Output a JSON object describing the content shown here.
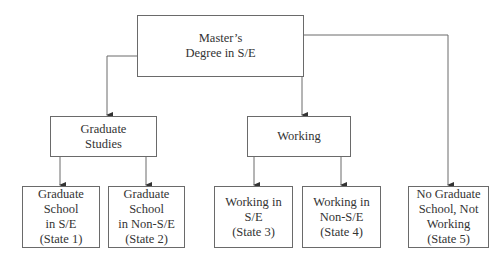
{
  "diagram": {
    "root": {
      "lines": [
        "Master’s",
        "Degree in S/E"
      ]
    },
    "branches": [
      {
        "id": "graduate-studies",
        "lines": [
          "Graduate",
          "Studies"
        ]
      },
      {
        "id": "working",
        "lines": [
          "Working"
        ]
      }
    ],
    "states": [
      {
        "id": "state-1",
        "lines": [
          "Graduate School",
          "in S/E",
          "(State 1)"
        ]
      },
      {
        "id": "state-2",
        "lines": [
          "Graduate School",
          "in Non-S/E",
          "(State 2)"
        ]
      },
      {
        "id": "state-3",
        "lines": [
          "Working in",
          "S/E",
          "(State 3)"
        ]
      },
      {
        "id": "state-4",
        "lines": [
          "Working in",
          "Non-S/E",
          "(State 4)"
        ]
      },
      {
        "id": "state-5",
        "lines": [
          "No Graduate",
          "School, Not",
          "Working",
          "(State 5)"
        ]
      }
    ],
    "colors": {
      "line": "#6a6a6a",
      "text": "#333333",
      "background": "#ffffff"
    }
  }
}
